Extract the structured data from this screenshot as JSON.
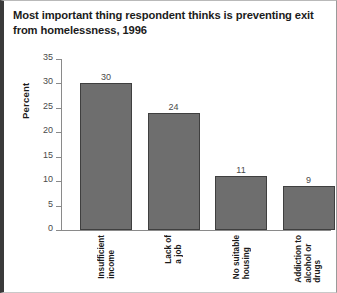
{
  "chart_data": {
    "type": "bar",
    "title": "Most important thing respondent thinks is preventing exit from homelessness, 1996",
    "title_lines": [
      "Most important thing respondent thinks is preventing exit",
      "from homelessness, 1996"
    ],
    "xlabel": "",
    "ylabel": "Percent",
    "ylim": [
      0,
      35
    ],
    "yticks": [
      0,
      5,
      10,
      15,
      20,
      25,
      30,
      35
    ],
    "ytick_labels": [
      "0",
      "5",
      "10",
      "15",
      "20",
      "25",
      "30",
      "35"
    ],
    "grid": false,
    "legend": false,
    "categories": [
      "Insufficient income",
      "Lack of a job",
      "No suitable housing",
      "Addiction to alcohol or drugs"
    ],
    "category_label_lines": [
      [
        "Insufficient",
        "income"
      ],
      [
        "Lack of",
        "a job"
      ],
      [
        "No suitable",
        "housing"
      ],
      [
        "Addiction to",
        "alcohol or",
        "drugs"
      ]
    ],
    "values": [
      30,
      24,
      11,
      9
    ],
    "value_labels": [
      "30",
      "24",
      "11",
      "9"
    ],
    "bar_fill_color": "#6e6e6e",
    "bar_border_color": "#3f3f3f",
    "axis_color": "#8a8a8a",
    "text_color": "#1b1b1b",
    "background_color": "#ffffff"
  }
}
